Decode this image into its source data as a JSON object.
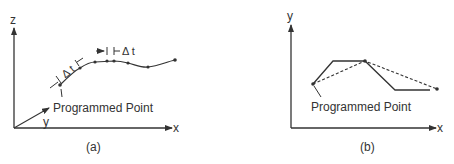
{
  "panel_a": {
    "caption": "(a)",
    "axis_z": "z",
    "axis_y": "y",
    "axis_x": "x",
    "delta_label_1": "Δ t",
    "delta_label_2": "Δ t",
    "programmed_point_label": "Programmed Point"
  },
  "panel_b": {
    "caption": "(b)",
    "axis_y": "y",
    "axis_x": "x",
    "programmed_point_label": "Programmed Point"
  },
  "colors": {
    "line": "#333333",
    "background": "#ffffff"
  }
}
